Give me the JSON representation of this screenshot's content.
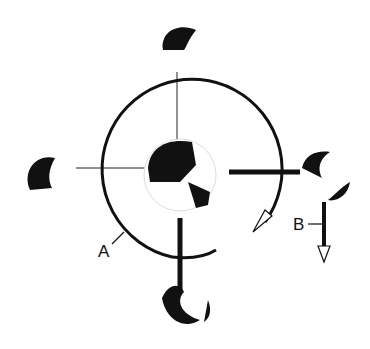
{
  "diagram": {
    "labels": {
      "a": "A",
      "b": "B"
    },
    "colors": {
      "ink": "#111111",
      "background": "#ffffff"
    }
  }
}
